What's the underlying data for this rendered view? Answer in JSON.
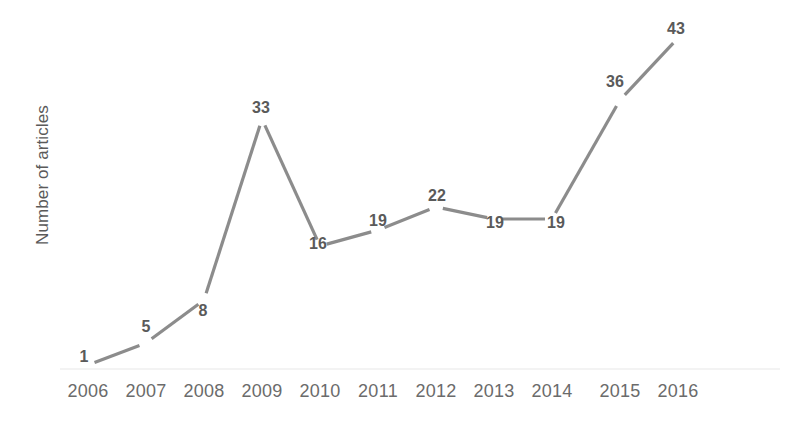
{
  "chart_data": {
    "type": "line",
    "title": "",
    "xlabel": "",
    "ylabel": "Number of articles",
    "categories": [
      "2006",
      "2007",
      "2008",
      "2009",
      "2010",
      "2011",
      "2012",
      "2013",
      "2014",
      "2015",
      "2016"
    ],
    "values": [
      1,
      5,
      8,
      33,
      16,
      19,
      22,
      19,
      19,
      36,
      43
    ],
    "point_labels": [
      "1",
      "5",
      "8",
      "33",
      "16",
      "19",
      "22",
      "19",
      "19",
      "36",
      "43"
    ],
    "ylim": [
      0,
      46
    ],
    "grid": false,
    "legend": null,
    "legend_position": "none",
    "axis_baseline_visible": true,
    "series": [
      {
        "name": "Number of articles",
        "values": [
          1,
          5,
          8,
          33,
          16,
          19,
          22,
          19,
          19,
          36,
          43
        ]
      }
    ]
  },
  "colors": {
    "line": "#8c8c8c",
    "data_label": "#5a5a5a",
    "tick_label": "#6b6b6b",
    "axis_title": "#5a5a5a",
    "baseline": "#e4e4e4",
    "background": "#ffffff"
  },
  "geometry": {
    "points": [
      {
        "x": 88,
        "y": 365,
        "label_x": 84,
        "label_y": 357
      },
      {
        "x": 146,
        "y": 343,
        "label_x": 146,
        "label_y": 327
      },
      {
        "x": 204,
        "y": 300,
        "label_x": 203,
        "label_y": 311
      },
      {
        "x": 262,
        "y": 119,
        "label_x": 261,
        "label_y": 108
      },
      {
        "x": 320,
        "y": 246,
        "label_x": 318,
        "label_y": 244
      },
      {
        "x": 378,
        "y": 230,
        "label_x": 378,
        "label_y": 221
      },
      {
        "x": 436,
        "y": 207,
        "label_x": 437,
        "label_y": 196
      },
      {
        "x": 494,
        "y": 219,
        "label_x": 495,
        "label_y": 223
      },
      {
        "x": 552,
        "y": 219,
        "label_x": 556,
        "label_y": 223
      },
      {
        "x": 620,
        "y": 100,
        "label_x": 615,
        "label_y": 82
      },
      {
        "x": 678,
        "y": 38,
        "label_x": 676,
        "label_y": 29
      }
    ],
    "tick_x": [
      88,
      146,
      204,
      262,
      320,
      378,
      436,
      494,
      552,
      620,
      678
    ],
    "baseline": {
      "x1": 60,
      "x2": 780,
      "y": 369
    }
  }
}
